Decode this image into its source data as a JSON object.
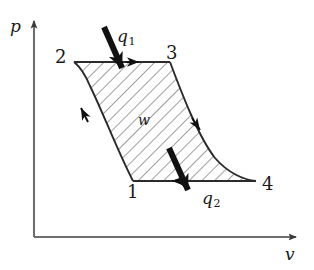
{
  "figure": {
    "type": "thermodynamic-pv-diagram",
    "background_color": "#ffffff",
    "line_color": "#333333",
    "hatch_color": "#555555",
    "arrow_color": "#111111"
  },
  "axes": {
    "x_label": "v",
    "y_label": "p",
    "origin": {
      "x": 34,
      "y": 237
    },
    "x_axis_end": {
      "x": 304,
      "y": 237
    },
    "y_axis_end": {
      "x": 34,
      "y": 17
    }
  },
  "states": [
    {
      "id": "1",
      "label": "1",
      "point": {
        "x": 133,
        "y": 181
      },
      "label_pos": {
        "x": 127,
        "y": 183
      }
    },
    {
      "id": "2",
      "label": "2",
      "point": {
        "x": 74,
        "y": 62
      },
      "label_pos": {
        "x": 55,
        "y": 48
      }
    },
    {
      "id": "3",
      "label": "3",
      "point": {
        "x": 170,
        "y": 62
      },
      "label_pos": {
        "x": 166,
        "y": 44
      }
    },
    {
      "id": "4",
      "label": "4",
      "point": {
        "x": 256,
        "y": 181
      },
      "label_pos": {
        "x": 262,
        "y": 175
      }
    }
  ],
  "processes": [
    {
      "from": "2",
      "to": "3",
      "kind": "isobaric-top-edge",
      "direction": "right"
    },
    {
      "from": "3",
      "to": "4",
      "kind": "expansion-curve",
      "direction": "down-right"
    },
    {
      "from": "4",
      "to": "1",
      "kind": "isobaric-bottom-edge",
      "direction": "left"
    },
    {
      "from": "1",
      "to": "2",
      "kind": "compression-curve",
      "direction": "up-left"
    }
  ],
  "annotations": {
    "heat_in": {
      "symbol": "q",
      "subscript": "1",
      "label_pos": {
        "x": 117,
        "y": 28
      }
    },
    "heat_out": {
      "symbol": "q",
      "subscript": "2",
      "label_pos": {
        "x": 202,
        "y": 190
      }
    },
    "work": {
      "symbol": "w",
      "label_pos": {
        "x": 138,
        "y": 113
      }
    }
  },
  "hatching": {
    "pattern": "diagonal-lines",
    "angle_deg": 45,
    "spacing_px": 8
  }
}
